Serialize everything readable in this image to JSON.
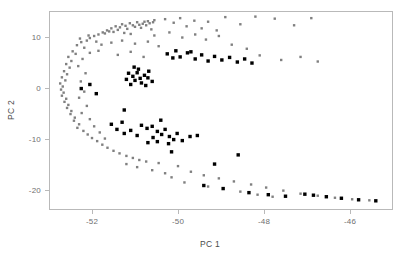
{
  "chart_data": {
    "type": "scatter",
    "title": "",
    "xlabel": "PC 1",
    "ylabel": "PC 2",
    "xlim": [
      -53.0,
      -45.0
    ],
    "ylim": [
      -24.0,
      15.0
    ],
    "xticks": [
      -52,
      -50,
      -48,
      -46
    ],
    "yticks": [
      10,
      0,
      -10,
      -20
    ],
    "xtick_labels": [
      "-52",
      "-50",
      "-48",
      "-46"
    ],
    "ytick_labels": [
      "10",
      "0",
      "-10",
      "-20"
    ],
    "grid": false,
    "legend": false,
    "frame": true,
    "series": [
      {
        "name": "group-gray",
        "color": "#808080",
        "marker": "square",
        "size": 2.4,
        "points": [
          [
            -51.55,
            11.6
          ],
          [
            -51.45,
            12.0
          ],
          [
            -51.35,
            11.8
          ],
          [
            -51.3,
            12.4
          ],
          [
            -51.22,
            12.1
          ],
          [
            -51.18,
            11.5
          ],
          [
            -51.12,
            12.6
          ],
          [
            -51.05,
            12.2
          ],
          [
            -51.0,
            11.9
          ],
          [
            -50.95,
            12.8
          ],
          [
            -50.9,
            12.3
          ],
          [
            -50.86,
            11.7
          ],
          [
            -50.82,
            12.5
          ],
          [
            -50.78,
            12.9
          ],
          [
            -50.74,
            12.2
          ],
          [
            -50.7,
            13.0
          ],
          [
            -50.66,
            12.6
          ],
          [
            -50.62,
            11.4
          ],
          [
            -50.58,
            12.8
          ],
          [
            -50.55,
            13.2
          ],
          [
            -51.65,
            11.2
          ],
          [
            -51.75,
            10.8
          ],
          [
            -51.85,
            10.4
          ],
          [
            -51.95,
            10.1
          ],
          [
            -52.05,
            9.7
          ],
          [
            -52.12,
            9.2
          ],
          [
            -51.7,
            10.6
          ],
          [
            -51.6,
            11.0
          ],
          [
            -51.5,
            10.9
          ],
          [
            -51.4,
            11.3
          ],
          [
            -51.25,
            10.7
          ],
          [
            -51.1,
            10.5
          ],
          [
            -52.25,
            8.9
          ],
          [
            -52.35,
            8.3
          ],
          [
            -52.18,
            7.8
          ],
          [
            -52.45,
            7.1
          ],
          [
            -52.38,
            6.6
          ],
          [
            -52.55,
            6.0
          ],
          [
            -52.48,
            5.2
          ],
          [
            -52.6,
            4.6
          ],
          [
            -52.52,
            3.9
          ],
          [
            -52.65,
            3.2
          ],
          [
            -52.58,
            2.6
          ],
          [
            -52.7,
            2.0
          ],
          [
            -52.62,
            1.4
          ],
          [
            -52.74,
            0.8
          ],
          [
            -52.68,
            0.2
          ],
          [
            -52.72,
            -0.4
          ],
          [
            -52.66,
            -1.0
          ],
          [
            -52.7,
            -1.6
          ],
          [
            -52.6,
            -2.2
          ],
          [
            -52.64,
            -2.8
          ],
          [
            -52.55,
            -3.4
          ],
          [
            -52.58,
            -4.0
          ],
          [
            -52.48,
            -4.6
          ],
          [
            -52.5,
            -5.2
          ],
          [
            -52.4,
            -5.9
          ],
          [
            -52.42,
            -6.5
          ],
          [
            -52.3,
            -7.2
          ],
          [
            -52.34,
            -7.9
          ],
          [
            -52.2,
            -8.5
          ],
          [
            -52.1,
            -9.2
          ],
          [
            -52.0,
            -9.9
          ],
          [
            -51.88,
            -10.5
          ],
          [
            -51.76,
            -11.2
          ],
          [
            -51.64,
            -11.8
          ],
          [
            -51.5,
            -12.4
          ],
          [
            -51.36,
            -12.9
          ],
          [
            -51.2,
            -13.4
          ],
          [
            -51.05,
            -13.8
          ],
          [
            -50.9,
            -14.2
          ],
          [
            -50.74,
            -14.5
          ],
          [
            -52.28,
            9.6
          ],
          [
            -52.08,
            10.2
          ],
          [
            -51.9,
            9.0
          ],
          [
            -51.78,
            8.4
          ],
          [
            -52.22,
            5.6
          ],
          [
            -52.32,
            4.2
          ],
          [
            -52.15,
            2.8
          ],
          [
            -52.26,
            1.2
          ],
          [
            -52.18,
            -0.8
          ],
          [
            -52.3,
            -2.0
          ],
          [
            -52.12,
            -3.6
          ],
          [
            -52.24,
            -5.0
          ],
          [
            -52.05,
            -6.2
          ],
          [
            -51.95,
            -7.6
          ],
          [
            -51.82,
            -8.8
          ],
          [
            -51.7,
            -10.0
          ],
          [
            -50.3,
            13.4
          ],
          [
            -50.1,
            12.7
          ],
          [
            -49.95,
            13.6
          ],
          [
            -49.8,
            12.0
          ],
          [
            -49.62,
            13.1
          ],
          [
            -49.45,
            11.6
          ],
          [
            -49.3,
            12.9
          ],
          [
            -49.1,
            11.2
          ],
          [
            -48.9,
            13.8
          ],
          [
            -48.55,
            12.4
          ],
          [
            -48.2,
            13.9
          ],
          [
            -47.75,
            13.5
          ],
          [
            -47.3,
            12.2
          ],
          [
            -46.9,
            13.6
          ],
          [
            -50.55,
            10.2
          ],
          [
            -50.2,
            10.8
          ],
          [
            -49.9,
            9.8
          ],
          [
            -49.6,
            10.4
          ],
          [
            -49.35,
            9.4
          ],
          [
            -49.05,
            10.1
          ],
          [
            -48.75,
            8.4
          ],
          [
            -48.4,
            7.6
          ],
          [
            -48.1,
            6.3
          ],
          [
            -47.6,
            5.4
          ],
          [
            -47.15,
            6.0
          ],
          [
            -46.75,
            5.1
          ],
          [
            -51.3,
            9.2
          ],
          [
            -51.0,
            8.6
          ],
          [
            -50.7,
            9.0
          ],
          [
            -50.45,
            8.1
          ],
          [
            -51.55,
            8.8
          ],
          [
            -51.85,
            7.2
          ],
          [
            -52.05,
            6.8
          ],
          [
            -51.4,
            6.4
          ],
          [
            -51.1,
            7.0
          ],
          [
            -50.8,
            6.0
          ],
          [
            -51.2,
            -15.0
          ],
          [
            -50.95,
            -15.6
          ],
          [
            -50.6,
            -16.2
          ],
          [
            -50.3,
            -16.8
          ],
          [
            -50.0,
            -15.4
          ],
          [
            -49.7,
            -16.5
          ],
          [
            -49.4,
            -17.2
          ],
          [
            -49.05,
            -17.8
          ],
          [
            -48.7,
            -18.4
          ],
          [
            -48.3,
            -19.0
          ],
          [
            -47.95,
            -19.6
          ],
          [
            -47.55,
            -20.2
          ],
          [
            -47.15,
            -20.8
          ],
          [
            -46.75,
            -21.2
          ],
          [
            -46.35,
            -21.6
          ],
          [
            -45.95,
            -21.9
          ],
          [
            -45.55,
            -22.1
          ],
          [
            -48.55,
            -20.4
          ],
          [
            -48.15,
            -21.0
          ],
          [
            -47.8,
            -21.4
          ],
          [
            -49.3,
            -19.4
          ],
          [
            -49.85,
            -18.6
          ],
          [
            -50.15,
            -17.6
          ],
          [
            -50.45,
            -14.8
          ]
        ]
      },
      {
        "name": "group-black",
        "color": "#000000",
        "marker": "square",
        "size": 3.4,
        "points": [
          [
            -51.15,
            2.8
          ],
          [
            -51.05,
            2.2
          ],
          [
            -50.95,
            2.9
          ],
          [
            -50.88,
            1.8
          ],
          [
            -50.78,
            2.4
          ],
          [
            -51.0,
            1.4
          ],
          [
            -50.85,
            0.9
          ],
          [
            -51.1,
            0.6
          ],
          [
            -50.7,
            1.9
          ],
          [
            -50.68,
            3.2
          ],
          [
            -50.6,
            1.2
          ],
          [
            -50.92,
            3.6
          ],
          [
            -51.2,
            1.6
          ],
          [
            -50.75,
            0.4
          ],
          [
            -51.02,
            4.0
          ],
          [
            -50.25,
            6.6
          ],
          [
            -50.05,
            7.2
          ],
          [
            -49.95,
            6.0
          ],
          [
            -49.78,
            6.8
          ],
          [
            -49.6,
            5.6
          ],
          [
            -49.45,
            6.4
          ],
          [
            -49.3,
            5.2
          ],
          [
            -49.15,
            6.1
          ],
          [
            -48.98,
            5.4
          ],
          [
            -48.8,
            5.9
          ],
          [
            -48.62,
            5.0
          ],
          [
            -48.45,
            5.6
          ],
          [
            -48.28,
            4.8
          ],
          [
            -50.12,
            5.8
          ],
          [
            -49.7,
            7.0
          ],
          [
            -50.85,
            -7.4
          ],
          [
            -50.72,
            -8.0
          ],
          [
            -50.6,
            -7.6
          ],
          [
            -50.48,
            -8.6
          ],
          [
            -50.38,
            -9.2
          ],
          [
            -50.3,
            -8.2
          ],
          [
            -50.2,
            -9.6
          ],
          [
            -50.1,
            -10.2
          ],
          [
            -50.02,
            -9.0
          ],
          [
            -50.48,
            -10.6
          ],
          [
            -50.58,
            -9.8
          ],
          [
            -50.7,
            -10.8
          ],
          [
            -50.95,
            -9.4
          ],
          [
            -51.1,
            -8.4
          ],
          [
            -51.25,
            -9.0
          ],
          [
            -51.42,
            -8.2
          ],
          [
            -50.22,
            -11.0
          ],
          [
            -49.9,
            -10.4
          ],
          [
            -49.72,
            -9.6
          ],
          [
            -49.55,
            -9.4
          ],
          [
            -51.3,
            -6.8
          ],
          [
            -51.55,
            -7.2
          ],
          [
            -50.4,
            -6.4
          ],
          [
            -48.95,
            -19.8
          ],
          [
            -48.35,
            -20.6
          ],
          [
            -47.9,
            -21.0
          ],
          [
            -47.5,
            -21.3
          ],
          [
            -47.05,
            -20.9
          ],
          [
            -46.85,
            -21.1
          ],
          [
            -46.55,
            -21.4
          ],
          [
            -46.2,
            -21.7
          ],
          [
            -45.8,
            -22.0
          ],
          [
            -49.4,
            -19.2
          ],
          [
            -45.4,
            -22.2
          ],
          [
            -48.6,
            -13.2
          ],
          [
            -49.15,
            -15.0
          ],
          [
            -50.15,
            -12.6
          ],
          [
            -51.25,
            -4.4
          ],
          [
            -52.25,
            -0.2
          ],
          [
            -52.05,
            0.6
          ],
          [
            -51.9,
            -1.2
          ]
        ]
      }
    ]
  },
  "axes": {
    "xlabel": "PC 1",
    "ylabel": "PC 2"
  }
}
